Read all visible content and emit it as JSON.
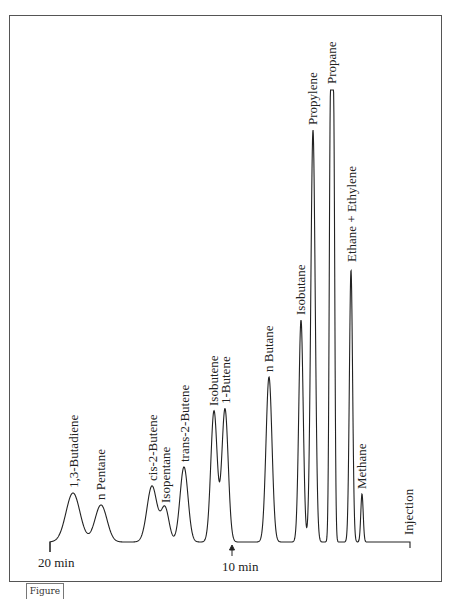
{
  "figure_tag": "Figure",
  "chart_data": {
    "type": "line",
    "title": "",
    "subtitle": "Gas chromatogram of light hydrocarbons",
    "xlabel": "Retention time (min), decreasing left to right from injection",
    "ylabel": "Detector response",
    "x_direction": "reversed",
    "axis_labels": {
      "start": "20 min",
      "mid": "10 min",
      "end": "Injection"
    },
    "grid": false,
    "legend": "none",
    "peaks": [
      {
        "name": "1,3-Butadiene",
        "time_min": 19.3,
        "rel_height": 0.11
      },
      {
        "name": "n Pentane",
        "time_min": 18.3,
        "rel_height": 0.08
      },
      {
        "name": "cis-2-Butene",
        "time_min": 16.4,
        "rel_height": 0.13
      },
      {
        "name": "Isopentane",
        "time_min": 16.0,
        "rel_height": 0.08
      },
      {
        "name": "trans-2-Butene",
        "time_min": 15.3,
        "rel_height": 0.17
      },
      {
        "name": "Isobutene",
        "time_min": 10.9,
        "rel_height": 0.29
      },
      {
        "name": "1-Butene",
        "time_min": 10.5,
        "rel_height": 0.3
      },
      {
        "name": "n Butane",
        "time_min": 8.8,
        "rel_height": 0.37
      },
      {
        "name": "Isobutane",
        "time_min": 7.4,
        "rel_height": 0.49
      },
      {
        "name": "Propylene",
        "time_min": 7.0,
        "rel_height": 0.91
      },
      {
        "name": "Propane",
        "time_min": 6.4,
        "rel_height": 1.0,
        "note": "off-scale (flat top)"
      },
      {
        "name": "Ethane + Ethylene",
        "time_min": 5.6,
        "rel_height": 0.61
      },
      {
        "name": "Methane",
        "time_min": 5.2,
        "rel_height": 0.11
      }
    ],
    "labels": [
      "1,3-Butadiene",
      "n Pentane",
      "cis-2-Butene",
      "Isopentane",
      "trans-2-Butene",
      "Isobutene",
      "1-Butene",
      "n Butane",
      "Isobutane",
      "Propylene",
      "Propane",
      "Ethane + Ethylene",
      "Methane",
      "Injection"
    ]
  },
  "render": {
    "baseline_y": 542,
    "x_start": 50,
    "x_end": 410,
    "peaks_px": [
      {
        "x": 73,
        "top": 493,
        "w": 7
      },
      {
        "x": 101,
        "top": 505,
        "w": 6
      },
      {
        "x": 152,
        "top": 486,
        "w": 5
      },
      {
        "x": 165,
        "top": 508,
        "w": 4
      },
      {
        "x": 184,
        "top": 467,
        "w": 4
      },
      {
        "x": 214,
        "top": 411,
        "w": 3.2
      },
      {
        "x": 225,
        "top": 409,
        "w": 3.2
      },
      {
        "x": 269,
        "top": 377,
        "w": 3
      },
      {
        "x": 301,
        "top": 320,
        "w": 2.2
      },
      {
        "x": 313,
        "top": 130,
        "w": 2.2
      },
      {
        "x": 332,
        "top": 90,
        "w": 3,
        "flat": true
      },
      {
        "x": 351,
        "top": 270,
        "w": 1.6
      },
      {
        "x": 362,
        "top": 494,
        "w": 1.2
      }
    ],
    "label_pos": [
      {
        "x": 78,
        "y": 488
      },
      {
        "x": 105,
        "y": 500
      },
      {
        "x": 157,
        "y": 481
      },
      {
        "x": 170,
        "y": 503
      },
      {
        "x": 189,
        "y": 462
      },
      {
        "x": 218,
        "y": 406
      },
      {
        "x": 230,
        "y": 404
      },
      {
        "x": 273,
        "y": 372
      },
      {
        "x": 305,
        "y": 315
      },
      {
        "x": 317,
        "y": 125
      },
      {
        "x": 336,
        "y": 84
      },
      {
        "x": 356,
        "y": 262
      },
      {
        "x": 366,
        "y": 489
      },
      {
        "x": 413,
        "y": 535
      }
    ]
  }
}
